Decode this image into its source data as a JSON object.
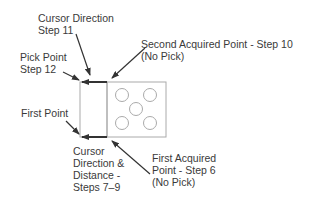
{
  "labels": {
    "cursor_direction": [
      "Cursor Direction",
      "Step 11"
    ],
    "pick_point": [
      "Pick Point",
      "Step 12"
    ],
    "second_acquired": [
      "Second Acquired Point - Step 10",
      "(No Pick)"
    ],
    "first_point": [
      "First Point"
    ],
    "cursor_distance": [
      "Cursor",
      "Direction &",
      "Distance -",
      "Steps 7–9"
    ],
    "first_acquired": [
      "First Acquired",
      "Point - Step 6",
      "(No Pick)"
    ]
  },
  "colors": {
    "stroke": "#999999",
    "arrow": "#333333",
    "text": "#3a3a3a"
  }
}
